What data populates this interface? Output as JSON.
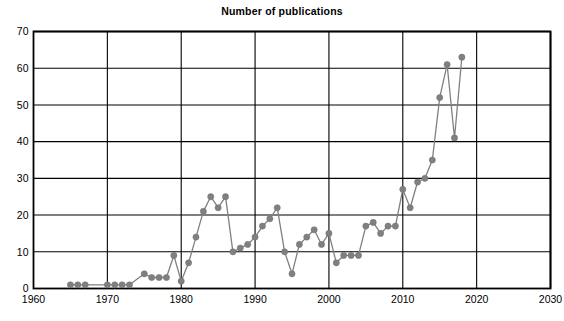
{
  "chart_data": {
    "type": "line",
    "title": "Number of publications",
    "xlabel": "",
    "ylabel": "",
    "xlim": [
      1960,
      2030
    ],
    "ylim": [
      0,
      70
    ],
    "xticks": [
      1960,
      1970,
      1980,
      1990,
      2000,
      2010,
      2020,
      2030
    ],
    "yticks": [
      0,
      10,
      20,
      30,
      40,
      50,
      60,
      70
    ],
    "grid": true,
    "legend": false,
    "marker": "circle",
    "series_color": "#808080",
    "axis_color": "#000000",
    "background_color": "#ffffff",
    "x": [
      1965,
      1966,
      1967,
      1970,
      1971,
      1972,
      1973,
      1975,
      1976,
      1977,
      1978,
      1979,
      1980,
      1981,
      1982,
      1983,
      1984,
      1985,
      1986,
      1987,
      1988,
      1989,
      1990,
      1991,
      1992,
      1993,
      1994,
      1995,
      1996,
      1997,
      1998,
      1999,
      2000,
      2001,
      2002,
      2003,
      2004,
      2005,
      2006,
      2007,
      2008,
      2009,
      2010,
      2011,
      2012,
      2013,
      2014,
      2015,
      2016,
      2017,
      2018
    ],
    "values": [
      1,
      1,
      1,
      1,
      1,
      1,
      1,
      4,
      3,
      3,
      3,
      9,
      2,
      7,
      14,
      21,
      25,
      22,
      25,
      10,
      11,
      12,
      14,
      17,
      19,
      22,
      10,
      4,
      12,
      14,
      16,
      12,
      15,
      7,
      9,
      9,
      9,
      17,
      18,
      15,
      17,
      17,
      27,
      22,
      29,
      30,
      35,
      52,
      61,
      41,
      63
    ],
    "series": [
      {
        "name": "Number of publications",
        "values": [
          1,
          1,
          1,
          1,
          1,
          1,
          1,
          4,
          3,
          3,
          3,
          9,
          2,
          7,
          14,
          21,
          25,
          22,
          25,
          10,
          11,
          12,
          14,
          17,
          19,
          22,
          10,
          4,
          12,
          14,
          16,
          12,
          15,
          7,
          9,
          9,
          9,
          17,
          18,
          15,
          17,
          17,
          27,
          22,
          29,
          30,
          35,
          52,
          61,
          41,
          63
        ]
      }
    ]
  }
}
